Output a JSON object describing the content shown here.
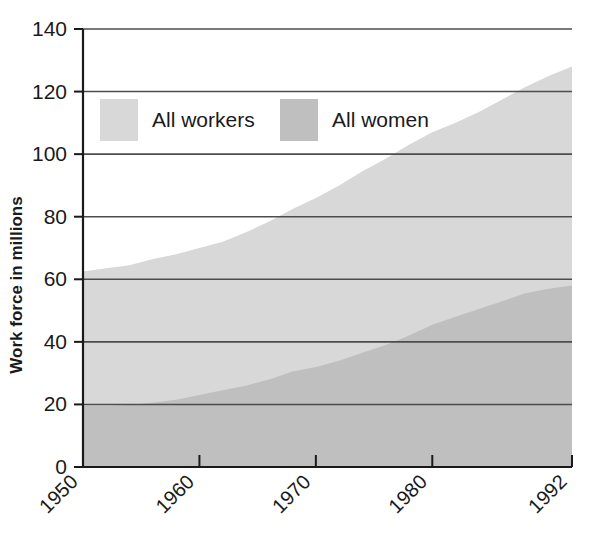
{
  "chart_data": {
    "type": "area",
    "title": "",
    "subtitle": "",
    "xlabel": "",
    "ylabel": "Work force in millions",
    "xlim": [
      1950,
      1992
    ],
    "ylim": [
      0,
      140
    ],
    "grid": true,
    "grid_axis": "y",
    "legend_position": "top-left-inside",
    "stacked": false,
    "overlaid": true,
    "x_tick_labels": [
      "1950",
      "1960",
      "1970",
      "1980",
      "1992"
    ],
    "x_ticks": [
      1950,
      1960,
      1970,
      1980,
      1992
    ],
    "y_tick_labels": [
      "0",
      "20",
      "40",
      "60",
      "80",
      "100",
      "120",
      "140"
    ],
    "y_ticks": [
      0,
      20,
      40,
      60,
      80,
      100,
      120,
      140
    ],
    "x": [
      1950,
      1952,
      1954,
      1956,
      1958,
      1960,
      1962,
      1964,
      1966,
      1968,
      1970,
      1972,
      1974,
      1976,
      1978,
      1980,
      1982,
      1984,
      1986,
      1988,
      1990,
      1992
    ],
    "series": [
      {
        "name": "All workers",
        "color": "#d8d8d8",
        "values": [
          62.5,
          63.5,
          64.5,
          66.5,
          68.0,
          70.0,
          72.0,
          75.0,
          78.5,
          82.5,
          86.0,
          90.0,
          94.5,
          98.5,
          103.0,
          107.0,
          110.0,
          113.5,
          117.5,
          121.5,
          125.0,
          128.0
        ]
      },
      {
        "name": "All women",
        "color": "#bfbfbf",
        "values": [
          19.5,
          19.5,
          19.8,
          20.5,
          21.5,
          23.0,
          24.5,
          26.0,
          28.0,
          30.5,
          32.0,
          34.0,
          36.5,
          39.0,
          42.0,
          45.5,
          48.0,
          50.5,
          53.0,
          55.5,
          57.0,
          58.0
        ]
      }
    ],
    "colors": {
      "all_workers": "#d8d8d8",
      "all_women": "#bfbfbf",
      "axis": "#1a1a1a",
      "gridline": "#4d4d4d",
      "text": "#1a1a1a",
      "background": "#ffffff"
    }
  },
  "legend": {
    "items": [
      {
        "label": "All workers",
        "swatch_color": "#d8d8d8"
      },
      {
        "label": "All women",
        "swatch_color": "#bfbfbf"
      }
    ]
  },
  "axes": {
    "y_title": "Work force in millions",
    "y_labels": [
      "140",
      "120",
      "100",
      "80",
      "60",
      "40",
      "20",
      "0"
    ],
    "x_labels": [
      "1950",
      "1960",
      "1970",
      "1980",
      "1992"
    ]
  }
}
